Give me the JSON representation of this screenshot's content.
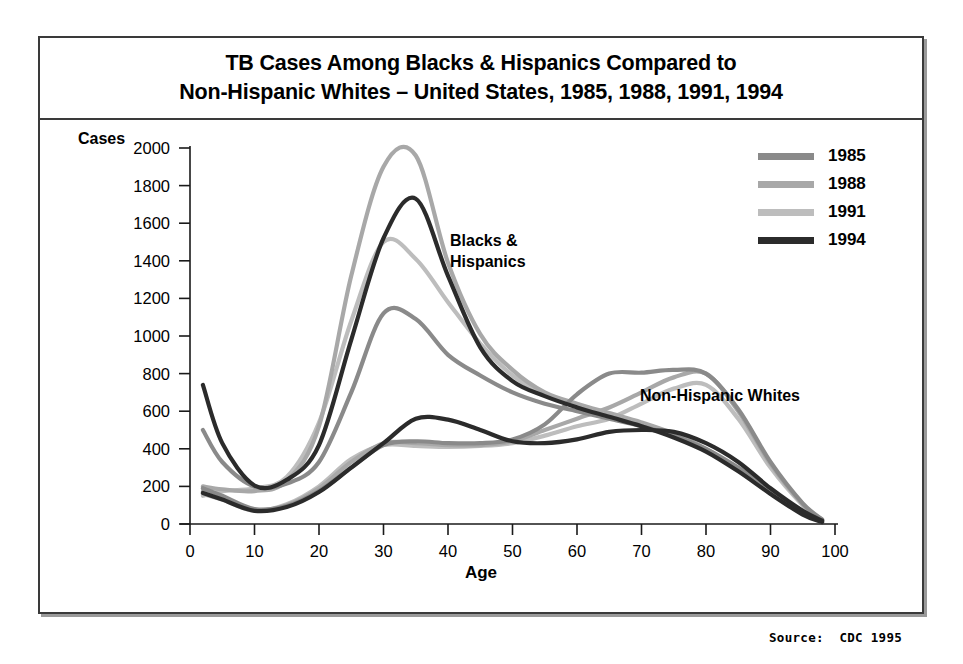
{
  "title": {
    "line1": "TB Cases Among Blacks & Hispanics Compared to",
    "line2": "Non-Hispanic Whites – United States, 1985, 1988, 1991, 1994"
  },
  "source": "Source:  CDC 1995",
  "annotations": {
    "blacks_hispanics_l1": "Blacks &",
    "blacks_hispanics_l2": "Hispanics",
    "non_hispanic_whites": "Non-Hispanic Whites"
  },
  "legend": {
    "position": "top-right",
    "entries": [
      {
        "label": "1985",
        "color": "#8a8a8a"
      },
      {
        "label": "1988",
        "color": "#a8a8a8"
      },
      {
        "label": "1991",
        "color": "#bdbdbd"
      },
      {
        "label": "1994",
        "color": "#2b2b2b"
      }
    ]
  },
  "chart_data": {
    "type": "line",
    "title": "TB Cases Among Blacks & Hispanics Compared to Non-Hispanic Whites – United States, 1985, 1988, 1991, 1994",
    "xlabel": "Age",
    "ylabel": "Cases",
    "xlim": [
      0,
      100
    ],
    "ylim": [
      0,
      2000
    ],
    "xticks": [
      0,
      10,
      20,
      30,
      40,
      50,
      60,
      70,
      80,
      90,
      100
    ],
    "yticks": [
      0,
      200,
      400,
      600,
      800,
      1000,
      1200,
      1400,
      1600,
      1800,
      2000
    ],
    "grid": false,
    "x": [
      2,
      5,
      10,
      15,
      20,
      25,
      30,
      35,
      40,
      45,
      50,
      55,
      60,
      65,
      70,
      75,
      80,
      85,
      90,
      95,
      98
    ],
    "series": [
      {
        "name": "1985",
        "group": "Blacks & Hispanics",
        "color": "#8a8a8a",
        "values": [
          500,
          330,
          200,
          215,
          330,
          700,
          1120,
          1090,
          900,
          790,
          700,
          640,
          600,
          560,
          520,
          470,
          400,
          300,
          180,
          60,
          15
        ]
      },
      {
        "name": "1988",
        "group": "Blacks & Hispanics",
        "color": "#a8a8a8",
        "values": [
          200,
          185,
          175,
          230,
          520,
          1320,
          1900,
          1960,
          1390,
          1010,
          820,
          700,
          640,
          590,
          540,
          480,
          400,
          290,
          170,
          55,
          15
        ]
      },
      {
        "name": "1991",
        "group": "Blacks & Hispanics",
        "color": "#bdbdbd",
        "values": [
          150,
          175,
          190,
          250,
          540,
          1080,
          1500,
          1410,
          1180,
          960,
          790,
          690,
          630,
          580,
          530,
          470,
          395,
          285,
          165,
          55,
          12
        ]
      },
      {
        "name": "1994",
        "group": "Blacks & Hispanics",
        "color": "#2b2b2b",
        "values": [
          740,
          430,
          205,
          235,
          420,
          980,
          1520,
          1730,
          1320,
          940,
          760,
          680,
          620,
          570,
          520,
          460,
          385,
          280,
          160,
          50,
          10
        ]
      },
      {
        "name": "1985",
        "group": "Non-Hispanic Whites",
        "color": "#8a8a8a",
        "values": [
          190,
          150,
          80,
          95,
          175,
          300,
          420,
          440,
          430,
          430,
          450,
          530,
          690,
          800,
          805,
          820,
          800,
          610,
          330,
          110,
          25
        ]
      },
      {
        "name": "1988",
        "group": "Non-Hispanic Whites",
        "color": "#a8a8a8",
        "values": [
          175,
          140,
          75,
          100,
          190,
          330,
          430,
          430,
          420,
          420,
          440,
          500,
          560,
          620,
          700,
          780,
          800,
          600,
          320,
          105,
          22
        ]
      },
      {
        "name": "1991",
        "group": "Non-Hispanic Whites",
        "color": "#bdbdbd",
        "values": [
          160,
          130,
          70,
          105,
          200,
          345,
          420,
          415,
          410,
          415,
          430,
          470,
          520,
          560,
          640,
          720,
          740,
          560,
          300,
          100,
          20
        ]
      },
      {
        "name": "1994",
        "group": "Non-Hispanic Whites",
        "color": "#2b2b2b",
        "values": [
          165,
          130,
          70,
          90,
          170,
          300,
          430,
          560,
          555,
          500,
          440,
          430,
          450,
          490,
          500,
          490,
          430,
          330,
          190,
          70,
          18
        ]
      }
    ]
  }
}
